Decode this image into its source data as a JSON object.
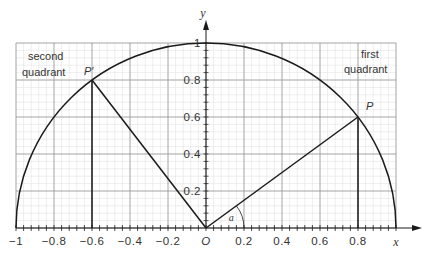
{
  "figure": {
    "type": "unit-circle-diagram",
    "axes": {
      "x_label": "x",
      "y_label": "y",
      "origin_label": "O",
      "x_range": [
        -1,
        1
      ],
      "y_range": [
        0,
        1
      ],
      "x_tick_labels": [
        {
          "value": -1,
          "text": "−1"
        },
        {
          "value": -0.8,
          "text": "−0.8"
        },
        {
          "value": -0.6,
          "text": "−0.6"
        },
        {
          "value": -0.4,
          "text": "−0.4"
        },
        {
          "value": -0.2,
          "text": "−0.2"
        },
        {
          "value": 0.2,
          "text": "0.2"
        },
        {
          "value": 0.4,
          "text": "0.4"
        },
        {
          "value": 0.6,
          "text": "0.6"
        },
        {
          "value": 0.8,
          "text": "0.8"
        }
      ],
      "y_tick_labels": [
        {
          "value": 0.2,
          "text": "0.2"
        },
        {
          "value": 0.4,
          "text": "0.4"
        },
        {
          "value": 0.6,
          "text": "0.6"
        },
        {
          "value": 0.8,
          "text": "0.8"
        },
        {
          "value": 1,
          "text": "1"
        }
      ],
      "major_step": 0.2,
      "minor_step": 0.04
    },
    "points": [
      {
        "name": "P",
        "label": "P",
        "x": 0.8,
        "y": 0.6
      },
      {
        "name": "P-prime",
        "label": "P′",
        "x": -0.6,
        "y": 0.8
      }
    ],
    "angle": {
      "label": "a",
      "radius": 0.2,
      "from_point": "P"
    },
    "quadrant_labels": {
      "second": [
        "second",
        "quadrant"
      ],
      "first": [
        "first",
        "quadrant"
      ]
    },
    "colors": {
      "major_grid": "#9a9a9a",
      "minor_grid": "#e2e2e2",
      "line": "#1a1a1a",
      "text": "#333333"
    }
  }
}
